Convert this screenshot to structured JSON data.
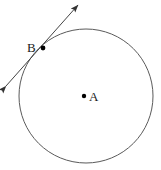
{
  "figure": {
    "type": "geometry-diagram",
    "width": 161,
    "height": 170,
    "background_color": "#ffffff",
    "stroke_color": "#555555",
    "point_color": "#000000",
    "label_color": "#1a1a1a",
    "circle": {
      "center_x": 86,
      "center_y": 96,
      "radius": 67,
      "fill": "none",
      "stroke_width": 1
    },
    "points": [
      {
        "name": "center-point",
        "label": "A",
        "x": 84,
        "y": 96,
        "radius": 2.2,
        "label_x": 89,
        "label_y": 90
      },
      {
        "name": "tangent-point",
        "label": "B",
        "x": 43,
        "y": 48,
        "radius": 2.4,
        "label_x": 27,
        "label_y": 41
      }
    ],
    "tangent_line": {
      "name": "tangent-line",
      "x1": 6,
      "y1": 86,
      "x2": 78,
      "y2": 5,
      "stroke_width": 1,
      "arrowheads": "both"
    }
  }
}
